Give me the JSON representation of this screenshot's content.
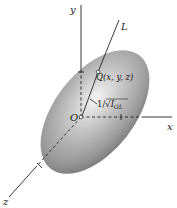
{
  "diagram": {
    "axes": {
      "y_label": "y",
      "x_label": "x",
      "z_label": "z",
      "line_label": "L"
    },
    "origin_label": "O",
    "point_label": "Q(x, y, z)",
    "distance_label": {
      "prefix": "1/√",
      "symbol": "I",
      "subscript": "OL"
    },
    "colors": {
      "ellipsoid_light": "#f2f2f2",
      "ellipsoid_mid": "#a8a8a8",
      "ellipsoid_dark": "#6e6e6e",
      "line": "#222222",
      "background": "#ffffff"
    }
  }
}
